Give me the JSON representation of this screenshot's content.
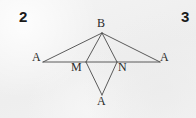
{
  "page": {
    "background_color": "#f2f2f2",
    "ink_color": "#444444",
    "text_color": "#2a2a2a",
    "width": 196,
    "height": 118
  },
  "page_numbers": {
    "left": "2",
    "right": "3"
  },
  "figure": {
    "labels": {
      "apex_top": "B",
      "endpoint_left": "A",
      "endpoint_right": "A",
      "base_point_left": "M",
      "base_point_right": "N",
      "apex_bottom": "A"
    },
    "points": {
      "B": {
        "x": 102,
        "y": 33
      },
      "A_left": {
        "x": 43,
        "y": 62
      },
      "A_right": {
        "x": 160,
        "y": 62
      },
      "M": {
        "x": 86,
        "y": 62
      },
      "N": {
        "x": 117,
        "y": 62
      },
      "A_bottom": {
        "x": 102,
        "y": 95
      }
    },
    "segments": [
      {
        "name": "base-line",
        "from": "A_left",
        "to": "A_right"
      },
      {
        "name": "b-to-a-left",
        "from": "B",
        "to": "A_left"
      },
      {
        "name": "b-to-a-right",
        "from": "B",
        "to": "A_right"
      },
      {
        "name": "b-to-m",
        "from": "B",
        "to": "M"
      },
      {
        "name": "b-to-n",
        "from": "B",
        "to": "N"
      },
      {
        "name": "m-to-a-bottom",
        "from": "M",
        "to": "A_bottom"
      },
      {
        "name": "n-to-a-bottom",
        "from": "N",
        "to": "A_bottom"
      }
    ]
  }
}
